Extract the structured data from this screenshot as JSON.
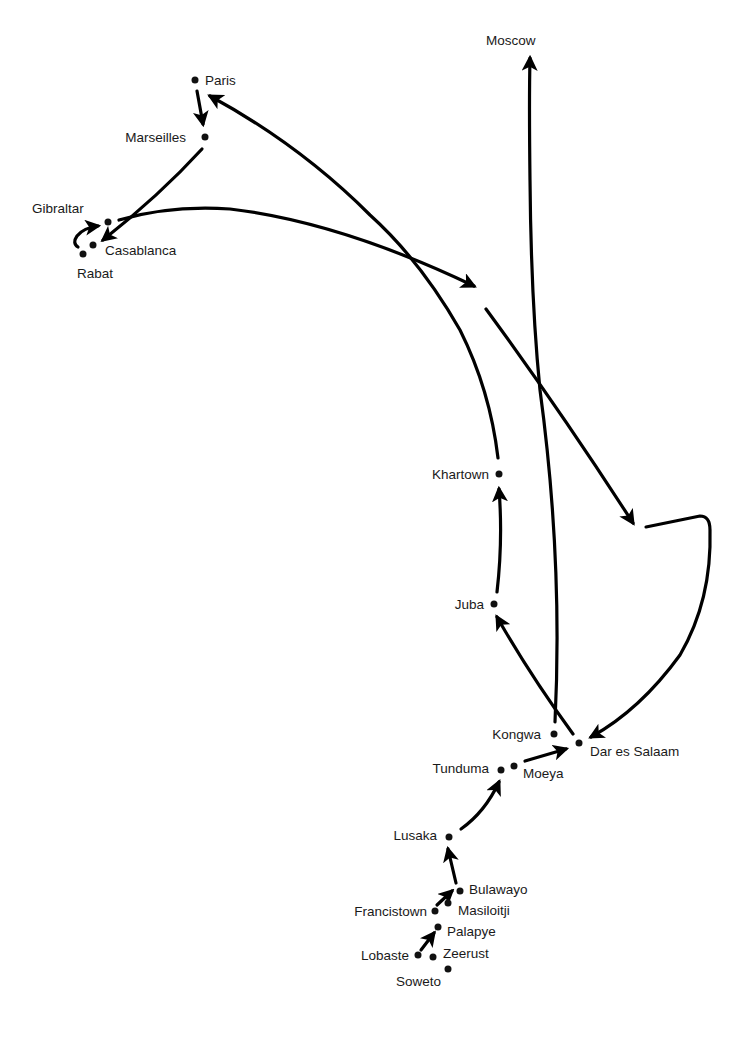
{
  "diagram": {
    "type": "route-map",
    "cities": [
      {
        "id": "paris",
        "label": "Paris",
        "x": 195,
        "y": 80
      },
      {
        "id": "marseilles",
        "label": "Marseilles",
        "x": 205,
        "y": 137
      },
      {
        "id": "gibraltar",
        "label": "Gibraltar",
        "x": 108,
        "y": 222
      },
      {
        "id": "casablanca",
        "label": "Casablanca",
        "x": 93,
        "y": 245
      },
      {
        "id": "rabat",
        "label": "Rabat",
        "x": 83,
        "y": 254
      },
      {
        "id": "moscow",
        "label": "Moscow",
        "x": 502,
        "y": 48
      },
      {
        "id": "khartown",
        "label": "Khartown",
        "x": 499,
        "y": 474
      },
      {
        "id": "juba",
        "label": "Juba",
        "x": 494,
        "y": 604
      },
      {
        "id": "kongwa",
        "label": "Kongwa",
        "x": 554,
        "y": 734
      },
      {
        "id": "dar_es_salaam",
        "label": "Dar es Salaam",
        "x": 579,
        "y": 743
      },
      {
        "id": "tunduma",
        "label": "Tunduma",
        "x": 501,
        "y": 770
      },
      {
        "id": "moeya",
        "label": "Moeya",
        "x": 514,
        "y": 766
      },
      {
        "id": "lusaka",
        "label": "Lusaka",
        "x": 449,
        "y": 837
      },
      {
        "id": "bulawayo",
        "label": "Bulawayo",
        "x": 460,
        "y": 891
      },
      {
        "id": "masiloitji",
        "label": "Masiloitji",
        "x": 448,
        "y": 903
      },
      {
        "id": "francistown",
        "label": "Francistown",
        "x": 435,
        "y": 911
      },
      {
        "id": "palapye",
        "label": "Palapye",
        "x": 438,
        "y": 927
      },
      {
        "id": "lobaste",
        "label": "Lobaste",
        "x": 418,
        "y": 955
      },
      {
        "id": "zeerust",
        "label": "Zeerust",
        "x": 433,
        "y": 957
      },
      {
        "id": "soweto",
        "label": "Soweto",
        "x": 448,
        "y": 969
      }
    ],
    "routes": [
      {
        "from": "Lobaste",
        "to": "Palapye"
      },
      {
        "from": "Francistown",
        "to": "Masiloitji"
      },
      {
        "from": "Bulawayo",
        "to": "Lusaka"
      },
      {
        "from": "Lusaka",
        "to": "Tunduma"
      },
      {
        "from": "Moeya",
        "to": "Dar es Salaam"
      },
      {
        "from": "Dar es Salaam",
        "to": "Juba"
      },
      {
        "from": "Juba",
        "to": "Khartown"
      },
      {
        "from": "Khartown",
        "to": "Paris"
      },
      {
        "from": "Paris",
        "to": "Marseilles"
      },
      {
        "from": "Marseilles",
        "to": "Casablanca"
      },
      {
        "from": "Rabat",
        "to": "Gibraltar"
      },
      {
        "from": "Gibraltar",
        "to": "(gap, mid-route)"
      },
      {
        "from": "(gap, mid-route)",
        "to": "(gap, east)"
      },
      {
        "from": "(gap, east)",
        "to": "Dar es Salaam"
      },
      {
        "from": "Kongwa",
        "to": "Moscow"
      }
    ]
  }
}
